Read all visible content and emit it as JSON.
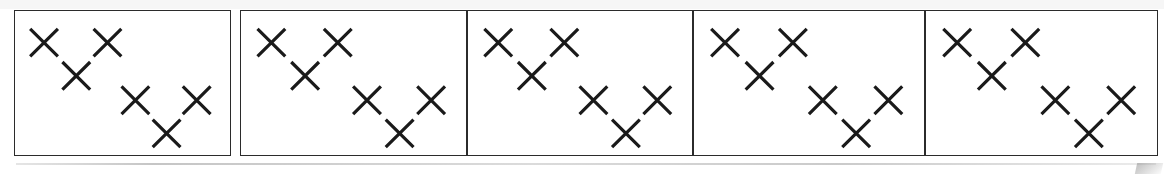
{
  "figure": {
    "title": "",
    "caption": "",
    "panel_count": 5,
    "markers_per_panel": 6,
    "marker_glyph": "x-mark",
    "ink_color": "#1a1a1a",
    "border_color": "#2b2b2b",
    "background_color": "#ffffff"
  },
  "chart_data": {
    "type": "scatter",
    "title": "",
    "subtitle": "",
    "xlabel": "",
    "ylabel": "",
    "xlim": [
      0,
      100
    ],
    "ylim": [
      0,
      100
    ],
    "grid": false,
    "legend": null,
    "marker": "x",
    "panels": [
      {
        "label": "",
        "index": 1,
        "points": [
          {
            "x": 13.5,
            "y": 78.0
          },
          {
            "x": 43.0,
            "y": 78.0
          },
          {
            "x": 28.5,
            "y": 55.0
          },
          {
            "x": 56.0,
            "y": 38.0
          },
          {
            "x": 84.5,
            "y": 38.0
          },
          {
            "x": 70.5,
            "y": 15.0
          }
        ]
      },
      {
        "label": "",
        "index": 2,
        "points": [
          {
            "x": 13.5,
            "y": 78.0
          },
          {
            "x": 43.0,
            "y": 78.0
          },
          {
            "x": 28.5,
            "y": 55.0
          },
          {
            "x": 56.0,
            "y": 38.0
          },
          {
            "x": 84.5,
            "y": 38.0
          },
          {
            "x": 70.5,
            "y": 15.0
          }
        ]
      },
      {
        "label": "",
        "index": 3,
        "points": [
          {
            "x": 13.5,
            "y": 78.0
          },
          {
            "x": 43.0,
            "y": 78.0
          },
          {
            "x": 28.5,
            "y": 55.0
          },
          {
            "x": 56.0,
            "y": 38.0
          },
          {
            "x": 84.5,
            "y": 38.0
          },
          {
            "x": 70.5,
            "y": 15.0
          }
        ]
      },
      {
        "label": "",
        "index": 4,
        "points": [
          {
            "x": 13.5,
            "y": 78.0
          },
          {
            "x": 43.0,
            "y": 78.0
          },
          {
            "x": 28.5,
            "y": 55.0
          },
          {
            "x": 56.0,
            "y": 38.0
          },
          {
            "x": 84.5,
            "y": 38.0
          },
          {
            "x": 70.5,
            "y": 15.0
          }
        ]
      },
      {
        "label": "",
        "index": 5,
        "points": [
          {
            "x": 13.5,
            "y": 78.0
          },
          {
            "x": 43.0,
            "y": 78.0
          },
          {
            "x": 28.5,
            "y": 55.0
          },
          {
            "x": 56.0,
            "y": 38.0
          },
          {
            "x": 84.5,
            "y": 38.0
          },
          {
            "x": 70.5,
            "y": 15.0
          }
        ]
      }
    ]
  },
  "layout": {
    "panel_boxes": [
      {
        "left": 14,
        "top": 10,
        "width": 217,
        "height": 146
      },
      {
        "left": 240,
        "top": 10,
        "width": 227,
        "height": 146
      },
      {
        "left": 467,
        "top": 10,
        "width": 226,
        "height": 146
      },
      {
        "left": 693,
        "top": 10,
        "width": 232,
        "height": 146
      },
      {
        "left": 925,
        "top": 10,
        "width": 233,
        "height": 146
      }
    ],
    "marker_size_px": 28,
    "marker_stroke_px": 3.2
  }
}
